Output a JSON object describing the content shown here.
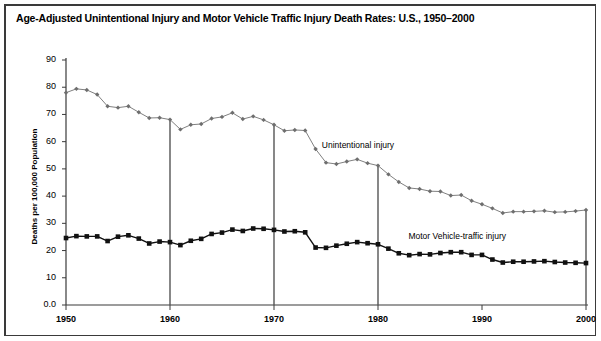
{
  "title": "Age-Adjusted Unintentional Injury and Motor Vehicle Traffic Injury Death Rates: U.S., 1950–2000",
  "axes": {
    "ylabel": "Deaths per 100,000 Population",
    "y_ticks": [
      "0.0",
      "10",
      "20",
      "30",
      "40",
      "50",
      "60",
      "70",
      "80",
      "90"
    ],
    "x_ticks": [
      "1950",
      "1960",
      "1970",
      "1980",
      "1990",
      "2000"
    ]
  },
  "annotations": {
    "unintentional": "Unintentional injury",
    "motor_vehicle": "Motor Vehicle-traffic injury"
  },
  "colors": {
    "unintentional_line": "#808080",
    "unintentional_marker": "#6e6e6e",
    "motor_vehicle_line": "#111111",
    "motor_vehicle_marker": "#000000",
    "axis": "#3a3a3a",
    "reference_line": "#555555",
    "frame": "#3a3a3a",
    "background": "#ffffff"
  },
  "chart_data": {
    "type": "line",
    "title": "Age-Adjusted Unintentional Injury and Motor Vehicle Traffic Injury Death Rates: U.S., 1950–2000",
    "xlabel": "",
    "ylabel": "Deaths per 100,000 Population",
    "xlim": [
      1950,
      2000
    ],
    "ylim": [
      0,
      90
    ],
    "grid": false,
    "legend": "inline-annotations",
    "x": [
      1950,
      1951,
      1952,
      1953,
      1954,
      1955,
      1956,
      1957,
      1958,
      1959,
      1960,
      1961,
      1962,
      1963,
      1964,
      1965,
      1966,
      1967,
      1968,
      1969,
      1970,
      1971,
      1972,
      1973,
      1974,
      1975,
      1976,
      1977,
      1978,
      1979,
      1980,
      1981,
      1982,
      1983,
      1984,
      1985,
      1986,
      1987,
      1988,
      1989,
      1990,
      1991,
      1992,
      1993,
      1994,
      1995,
      1996,
      1997,
      1998,
      1999,
      2000
    ],
    "series": [
      {
        "name": "Unintentional injury",
        "marker": "diamond",
        "color": "#808080",
        "values": [
          78.0,
          79.4,
          79.0,
          77.3,
          73.0,
          72.5,
          73.0,
          70.8,
          68.7,
          68.8,
          68.1,
          64.5,
          66.2,
          66.5,
          68.5,
          69.1,
          70.6,
          68.3,
          69.3,
          68.0,
          66.2,
          64.0,
          64.3,
          64.1,
          57.3,
          52.3,
          51.8,
          52.7,
          53.5,
          52.1,
          51.2,
          48.0,
          45.2,
          43.0,
          42.6,
          41.8,
          41.7,
          40.2,
          40.4,
          38.3,
          37.0,
          35.5,
          33.8,
          34.3,
          34.3,
          34.4,
          34.6,
          34.1,
          34.2,
          34.5,
          34.9
        ]
      },
      {
        "name": "Motor Vehicle-traffic injury",
        "marker": "square",
        "color": "#111111",
        "values": [
          24.6,
          25.3,
          25.2,
          25.2,
          23.5,
          25.1,
          25.6,
          24.4,
          22.6,
          23.3,
          23.1,
          22.0,
          23.6,
          24.3,
          26.1,
          26.6,
          27.7,
          27.2,
          28.1,
          28.0,
          27.6,
          27.0,
          27.1,
          26.7,
          21.1,
          21.0,
          21.8,
          22.5,
          23.1,
          22.7,
          22.3,
          20.7,
          19.0,
          18.3,
          18.7,
          18.6,
          19.1,
          19.4,
          19.4,
          18.4,
          18.4,
          16.7,
          15.6,
          15.9,
          15.9,
          16.0,
          16.1,
          15.8,
          15.6,
          15.5,
          15.4
        ]
      }
    ],
    "reference_lines": [
      {
        "x": 1960,
        "from_y": 68.1,
        "to_y": 0
      },
      {
        "x": 1970,
        "from_y": 66.2,
        "to_y": 0
      },
      {
        "x": 1980,
        "from_y": 51.2,
        "to_y": 0
      },
      {
        "x": 2000,
        "from_y": 34.9,
        "to_y": 0
      }
    ]
  }
}
